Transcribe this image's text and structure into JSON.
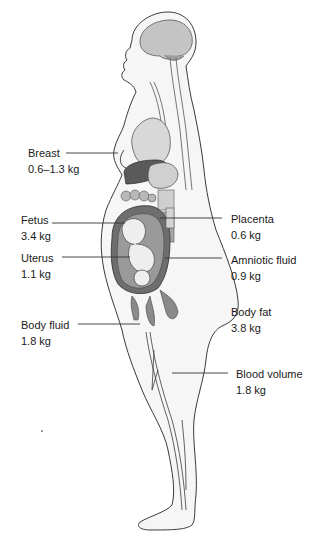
{
  "diagram": {
    "labels": {
      "breast": {
        "name": "Breast",
        "value": "0.6–1.3 kg"
      },
      "fetus": {
        "name": "Fetus",
        "value": "3.4 kg"
      },
      "uterus": {
        "name": "Uterus",
        "value": "1.1 kg"
      },
      "body_fluid": {
        "name": "Body fluid",
        "value": "1.8 kg"
      },
      "placenta": {
        "name": "Placenta",
        "value": "0.6 kg"
      },
      "amniotic_fluid": {
        "name": "Amniotic fluid",
        "value": "0.9 kg"
      },
      "body_fat": {
        "name": "Body fat",
        "value": "3.8 kg"
      },
      "blood_volume": {
        "name": "Blood volume",
        "value": "1.8 kg"
      }
    },
    "colors": {
      "outline": "#3a3a3a",
      "skin_fill": "#f4f4f4",
      "organ_light": "#d6d6d6",
      "organ_mid": "#9a9a9a",
      "organ_dark": "#5a5a5a",
      "uterus_wall": "#6e6e6e",
      "leader_line": "#333333"
    }
  }
}
